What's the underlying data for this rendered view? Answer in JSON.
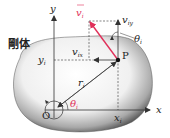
{
  "diagram": {
    "title": "剛体",
    "colors": {
      "axis": "#333333",
      "velocity": "#e0315a",
      "angle_label": "#e0315a",
      "body_fill_light": "#ffffff",
      "body_fill_dark": "#4a4a4a",
      "dashed": "#333333"
    },
    "labels": {
      "body": "剛体",
      "x_axis": "x",
      "y_axis": "y",
      "origin": "O",
      "point": "P",
      "position_vector": "r",
      "position_vector_sub": "i",
      "velocity": "v",
      "velocity_sub": "i",
      "vx": "v",
      "vx_sub": "ix",
      "vy": "v",
      "vy_sub": "iy",
      "theta_at_origin": "θ",
      "theta_at_origin_sub": "i",
      "theta_at_p": "θ",
      "theta_at_p_sub": "i",
      "x_coord": "x",
      "x_coord_sub": "i",
      "y_coord": "y",
      "y_coord_sub": "i"
    }
  }
}
